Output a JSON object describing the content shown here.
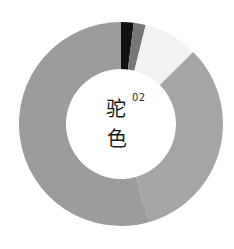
{
  "chart_data": {
    "type": "pie",
    "subtype": "donut",
    "title_chars": [
      "驼",
      "色"
    ],
    "index_label": "02",
    "start_angle_deg": 0,
    "direction": "clockwise",
    "center": [
      121,
      124
    ],
    "outer_radius": 102,
    "inner_radius": 55,
    "slices": [
      {
        "label": "black",
        "percent": 2.0,
        "color": "#111111"
      },
      {
        "label": "dark-gray",
        "percent": 1.9,
        "color": "#777777"
      },
      {
        "label": "off-white",
        "percent": 8.6,
        "color": "#f2f2f2"
      },
      {
        "label": "light-gray",
        "percent": 33.1,
        "color": "#a6a6a6"
      },
      {
        "label": "medium-gray",
        "percent": 54.4,
        "color": "#9c9c9c"
      }
    ],
    "legend": null,
    "xlabel": "",
    "ylabel": ""
  }
}
